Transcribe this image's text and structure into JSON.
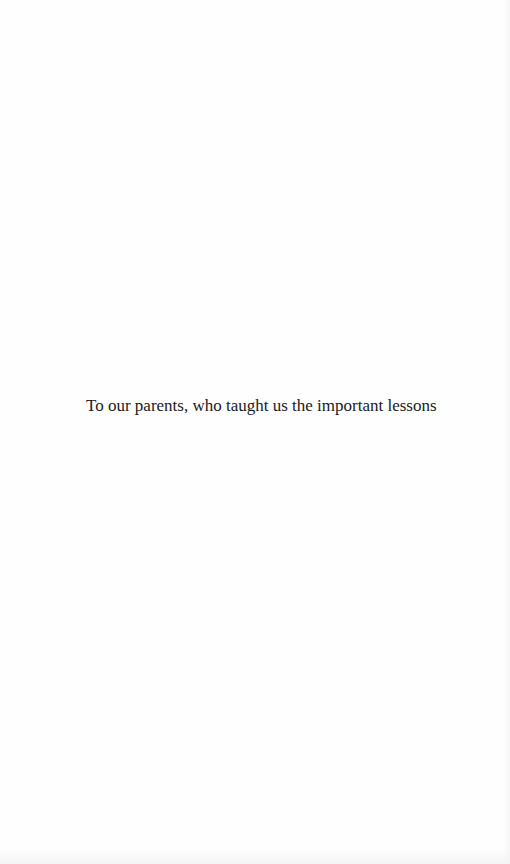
{
  "document": {
    "dedication": "To our parents, who taught us the important lessons"
  },
  "colors": {
    "page_background": "#fefefe",
    "text": "#1a1a1a"
  }
}
